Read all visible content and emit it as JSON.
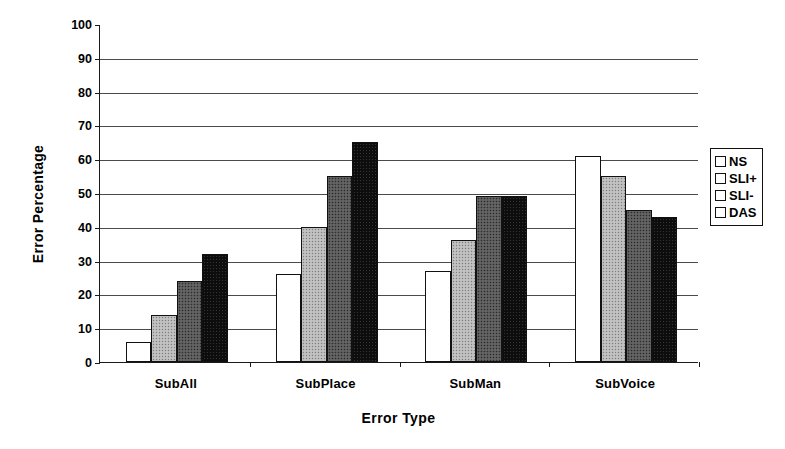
{
  "chart_data": {
    "type": "bar",
    "title": "",
    "xlabel": "Error Type",
    "ylabel": "Error Percentage",
    "categories": [
      "SubAll",
      "SubPlace",
      "SubMan",
      "SubVoice"
    ],
    "series": [
      {
        "name": "NS",
        "color": "#ffffff",
        "values": [
          6,
          26,
          27,
          61
        ]
      },
      {
        "name": "SLI+",
        "color": "#b9b9b9",
        "values": [
          14,
          40,
          36,
          55
        ]
      },
      {
        "name": "SLI-",
        "color": "#585858",
        "values": [
          24,
          55,
          49,
          45
        ]
      },
      {
        "name": "DAS",
        "color": "#0d0d0d",
        "values": [
          32,
          65,
          49,
          43
        ]
      }
    ],
    "ylim": [
      0,
      100
    ],
    "ytick_step": 10,
    "yticks": [
      0,
      10,
      20,
      30,
      40,
      50,
      60,
      70,
      80,
      90,
      100
    ],
    "ytick_labels": [
      "0",
      "10",
      "20",
      "30",
      "40",
      "50",
      "60",
      "70",
      "80",
      "90",
      "100"
    ],
    "grid": true,
    "grid_axis": "y",
    "legend_position": "right",
    "legend_entries": [
      "NS",
      "SLI+",
      "SLI-",
      "DAS"
    ]
  }
}
